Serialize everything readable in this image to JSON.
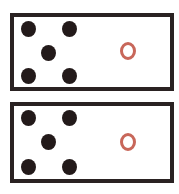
{
  "figure": {
    "panels": [
      {
        "id": "top",
        "dots": [
          {
            "x": 14,
            "y": 12
          },
          {
            "x": 55,
            "y": 12
          },
          {
            "x": 34,
            "y": 36
          },
          {
            "x": 14,
            "y": 59
          },
          {
            "x": 55,
            "y": 59
          }
        ],
        "ring": {
          "x": 114,
          "y": 34
        }
      },
      {
        "id": "bottom",
        "dots": [
          {
            "x": 14,
            "y": 12
          },
          {
            "x": 55,
            "y": 12
          },
          {
            "x": 34,
            "y": 36
          },
          {
            "x": 14,
            "y": 61
          },
          {
            "x": 55,
            "y": 61
          }
        ],
        "ring": {
          "x": 114,
          "y": 36
        }
      }
    ],
    "colors": {
      "border": "#2a2222",
      "dot": "#231a1a",
      "ring": "#c8675a",
      "background": "#ffffff"
    }
  }
}
